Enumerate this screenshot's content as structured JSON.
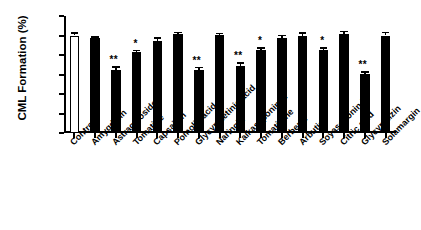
{
  "chart_data": {
    "type": "bar",
    "title": "",
    "xlabel": "",
    "ylabel": "CML Formation (%)",
    "ylim": [
      0,
      120
    ],
    "yticks": [
      0,
      20,
      40,
      60,
      80,
      100,
      120
    ],
    "grid": false,
    "legend": "none",
    "categories": [
      "Control",
      "Amygdalin",
      "Astragaloside I",
      "Tomatine",
      "Capsaicin",
      "Pomolic acid",
      "Glycyrrhetinic acid",
      "Naringin",
      "Kaikasaponin III",
      "Tomatidine",
      "Berberin",
      "Arbutin",
      "Soyasaponin I",
      "Citric acid",
      "Glycyrrhizin",
      "Solamargin"
    ],
    "values": [
      100,
      97,
      65,
      83,
      94,
      102,
      65,
      101,
      69,
      85,
      97,
      99,
      85,
      102,
      61,
      100
    ],
    "errors": [
      3.5,
      2.5,
      3.5,
      2.5,
      4.0,
      2.0,
      3.0,
      2.0,
      3.5,
      3.0,
      4.0,
      4.5,
      3.0,
      3.0,
      2.5,
      4.0
    ],
    "significance": [
      "",
      "",
      "**",
      "*",
      "",
      "",
      "**",
      "",
      "**",
      "*",
      "",
      "",
      "*",
      "",
      "**",
      ""
    ],
    "bar_styles": [
      "hollow",
      "filled",
      "filled",
      "filled",
      "filled",
      "filled",
      "filled",
      "filled",
      "filled",
      "filled",
      "filled",
      "filled",
      "filled",
      "filled",
      "filled",
      "filled"
    ],
    "colors": {
      "bar_fill": "#000000",
      "control_fill": "#ffffff",
      "axis": "#000000",
      "background": "#ffffff"
    }
  }
}
